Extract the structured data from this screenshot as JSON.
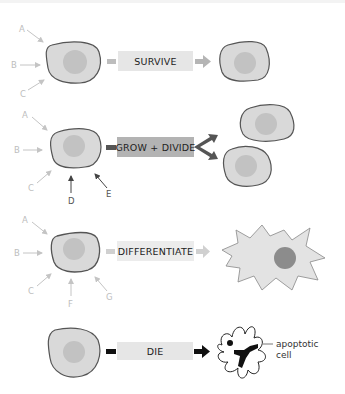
{
  "rows": [
    {
      "id": "survive",
      "action_label": "SURVIVE",
      "signals": [
        "A",
        "B",
        "C"
      ],
      "outcome": "surviving cell"
    },
    {
      "id": "grow-divide",
      "action_label": "GROW + DIVIDE",
      "signals": [
        "A",
        "B",
        "C",
        "D",
        "E"
      ],
      "outcome": "two daughter cells"
    },
    {
      "id": "differentiate",
      "action_label": "DIFFERENTIATE",
      "signals": [
        "A",
        "B",
        "C",
        "F",
        "G"
      ],
      "outcome": "differentiated cell"
    },
    {
      "id": "die",
      "action_label": "DIE",
      "signals": [],
      "outcome": "apoptotic cell"
    }
  ],
  "annotation": {
    "apoptotic_line1": "apoptotic",
    "apoptotic_line2": "cell"
  },
  "colors": {
    "cell_fill": "#d9d9d9",
    "cell_stroke": "#555555",
    "nucleus": "#bdbdbd",
    "box_light": "#e6e6e6",
    "box_mid": "#b0b0b0",
    "arrow_light": "#bfbfbf",
    "arrow_dark": "#555555",
    "arrow_black": "#111111",
    "diff_nucleus": "#8c8c8c"
  }
}
